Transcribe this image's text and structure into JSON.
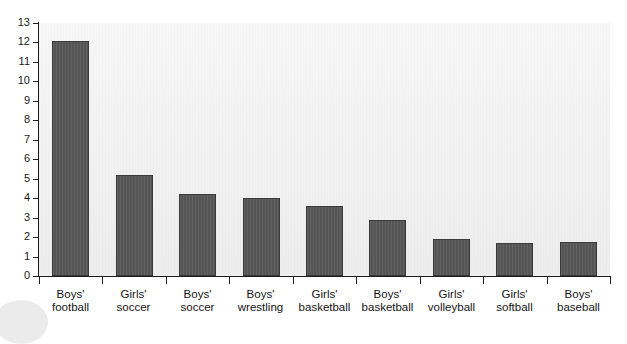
{
  "chart_data": {
    "type": "bar",
    "title": "",
    "subtitle": "",
    "xlabel": "",
    "ylabel": "",
    "ylim": [
      0,
      13
    ],
    "y_ticks": [
      0,
      1,
      2,
      3,
      4,
      5,
      6,
      7,
      8,
      9,
      10,
      11,
      12,
      13
    ],
    "grid": false,
    "legend": "none",
    "categories": [
      "Boys' football",
      "Girls' soccer",
      "Boys' soccer",
      "Boys' wrestling",
      "Girls' basketball",
      "Boys' basketball",
      "Girls' volleyball",
      "Girls' softball",
      "Boys' baseball"
    ],
    "category_lines": [
      [
        "Boys'",
        "football"
      ],
      [
        "Girls'",
        "soccer"
      ],
      [
        "Boys'",
        "soccer"
      ],
      [
        "Boys'",
        "wrestling"
      ],
      [
        "Girls'",
        "basketball"
      ],
      [
        "Boys'",
        "basketball"
      ],
      [
        "Girls'",
        "volleyball"
      ],
      [
        "Girls'",
        "softball"
      ],
      [
        "Boys'",
        "baseball"
      ]
    ],
    "values": [
      12.1,
      5.2,
      4.2,
      4.0,
      3.6,
      2.9,
      1.9,
      1.7,
      1.75
    ],
    "colors": {
      "bar_fill": "#585858",
      "bar_stroke": "#3a3a3a",
      "plot_background": "#f1f1f1",
      "axis": "#1c1c1c",
      "text": "#141414",
      "page_background": "#ffffff"
    }
  }
}
